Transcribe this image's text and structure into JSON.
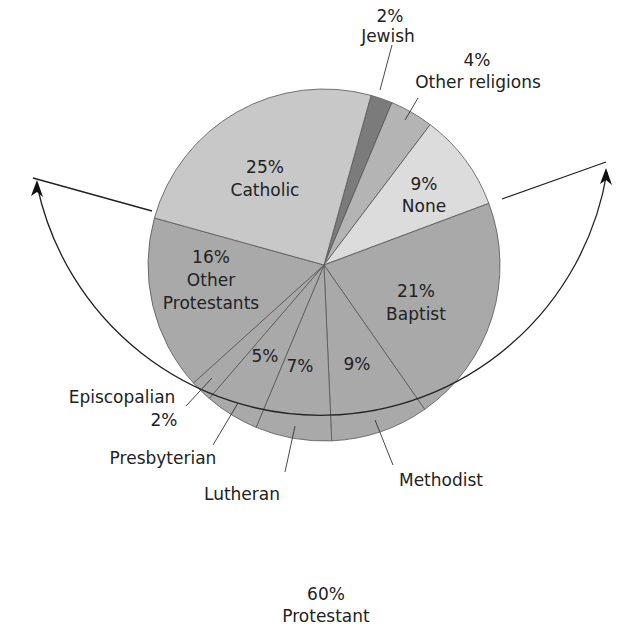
{
  "chart_data": {
    "type": "pie",
    "title": "",
    "start_angle_deg": 15.5,
    "direction": "clockwise",
    "slices": [
      {
        "label": "Jewish",
        "value": 2,
        "pct_label": "2%",
        "color": "#7b7b7b"
      },
      {
        "label": "Other religions",
        "value": 4,
        "pct_label": "4%",
        "color": "#b4b4b4"
      },
      {
        "label": "None",
        "value": 9,
        "pct_label": "9%",
        "color": "#dcdcdc"
      },
      {
        "label": "Baptist",
        "value": 21,
        "pct_label": "21%",
        "color": "#a9a9a9"
      },
      {
        "label": "Methodist",
        "value": 9,
        "pct_label": "9%",
        "color": "#a9a9a9"
      },
      {
        "label": "Lutheran",
        "value": 7,
        "pct_label": "7%",
        "color": "#a9a9a9"
      },
      {
        "label": "Presbyterian",
        "value": 5,
        "pct_label": "5%",
        "color": "#a9a9a9"
      },
      {
        "label": "Episcopalian",
        "value": 2,
        "pct_label": "2%",
        "color": "#a9a9a9"
      },
      {
        "label": "Other Protestants",
        "value": 16,
        "pct_label": "16%",
        "color": "#a9a9a9"
      },
      {
        "label": "Catholic",
        "value": 25,
        "pct_label": "25%",
        "color": "#c8c8c8"
      }
    ],
    "group_annotation": {
      "label": "Protestant",
      "pct_label": "60%",
      "members": [
        "Baptist",
        "Methodist",
        "Lutheran",
        "Presbyterian",
        "Episcopalian",
        "Other Protestants"
      ]
    }
  },
  "labels": {
    "jewish_pct": "2%",
    "jewish": "Jewish",
    "other_rel_pct": "4%",
    "other_rel": "Other religions",
    "none_pct": "9%",
    "none": "None",
    "catholic_pct": "25%",
    "catholic": "Catholic",
    "baptist_pct": "21%",
    "baptist": "Baptist",
    "other_prot_pct": "16%",
    "other_prot_1": "Other",
    "other_prot_2": "Protestants",
    "methodist_pct": "9%",
    "methodist": "Methodist",
    "lutheran_pct": "7%",
    "lutheran": "Lutheran",
    "presbyterian_pct": "5%",
    "presbyterian": "Presbyterian",
    "episcopalian": "Episcopalian",
    "episcopalian_pct": "2%",
    "protestant_pct": "60%",
    "protestant": "Protestant"
  }
}
